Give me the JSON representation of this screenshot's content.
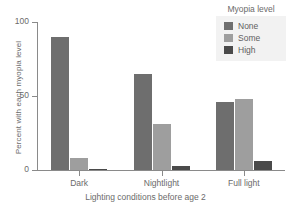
{
  "chart_data": {
    "type": "bar",
    "title": "",
    "xlabel": "Lighting conditions before age 2",
    "ylabel": "Percent with each myopia level",
    "categories": [
      "Dark",
      "Nightlight",
      "Full light"
    ],
    "series": [
      {
        "name": "None",
        "values": [
          90,
          65,
          46
        ],
        "color": "#6e6e6e"
      },
      {
        "name": "Some",
        "values": [
          8,
          31,
          48
        ],
        "color": "#9e9e9e"
      },
      {
        "name": "High",
        "values": [
          1,
          3,
          6
        ],
        "color": "#4a4a4a"
      }
    ],
    "ylim": [
      0,
      100
    ],
    "yticks": [
      0,
      50,
      100
    ],
    "ytick_labels": [
      "0",
      "50",
      "100"
    ],
    "grid": false,
    "legend": {
      "title": "Myopia level",
      "position": "top-right",
      "entries": [
        "None",
        "Some",
        "High"
      ]
    }
  },
  "axis": {
    "y_title": "Percent with each myopia level",
    "x_title": "Lighting conditions before age 2"
  },
  "colors": {
    "axis": "#8a8a8a",
    "text": "#6b6b6b",
    "legend_background": "#f2f2f2",
    "plot_background": "#ffffff"
  }
}
